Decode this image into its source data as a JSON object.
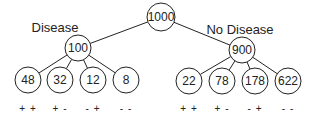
{
  "tree": {
    "root": {
      "label": "1000",
      "x": 161,
      "y": 17,
      "r": 14
    },
    "branches": [
      {
        "name": "Disease",
        "label": "Disease",
        "label_pos": {
          "x": 55,
          "y": 27
        },
        "node": {
          "label": "100",
          "x": 78,
          "y": 48,
          "r": 13
        },
        "leaves": [
          {
            "label": "48",
            "x": 28,
            "y": 80,
            "sign": "+ +"
          },
          {
            "label": "32",
            "x": 60,
            "y": 80,
            "sign": "+ -"
          },
          {
            "label": "12",
            "x": 93,
            "y": 80,
            "sign": "- +"
          },
          {
            "label": "8",
            "x": 126,
            "y": 80,
            "sign": "- -"
          }
        ]
      },
      {
        "name": "No Disease",
        "label": "No Disease",
        "label_pos": {
          "x": 240,
          "y": 29
        },
        "node": {
          "label": "900",
          "x": 242,
          "y": 50,
          "r": 13
        },
        "leaves": [
          {
            "label": "22",
            "x": 189,
            "y": 81,
            "sign": "+ +"
          },
          {
            "label": "78",
            "x": 222,
            "y": 81,
            "sign": "+ -"
          },
          {
            "label": "178",
            "x": 255,
            "y": 81,
            "sign": "- +"
          },
          {
            "label": "622",
            "x": 288,
            "y": 81,
            "sign": "- -"
          }
        ]
      }
    ],
    "leaf_radius": 13,
    "sign_y": 109
  },
  "colors": {
    "stroke": "#222222",
    "background": "#ffffff",
    "text": "#222222"
  }
}
